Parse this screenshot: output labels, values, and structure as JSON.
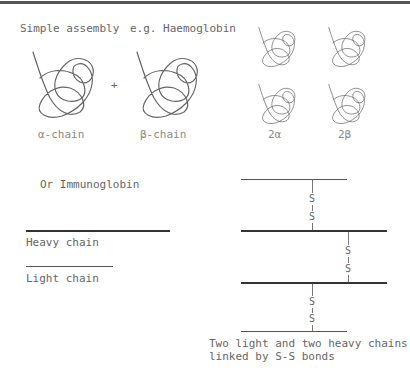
{
  "header": {
    "simple_assembly": "Simple assembly",
    "example": "e.g. Haemoglobin"
  },
  "haemoglobin": {
    "plus": "+",
    "alpha_label": "α-chain",
    "beta_label": "β-chain",
    "tetramer_alpha_label": "2α",
    "tetramer_beta_label": "2β"
  },
  "immunoglobin": {
    "title": "Or Immunoglobin",
    "heavy_label": "Heavy chain",
    "light_label": "Light chain",
    "bond_s": "S",
    "caption_line1": "Two light and two heavy chains",
    "caption_line2": "linked by S-S bonds"
  }
}
